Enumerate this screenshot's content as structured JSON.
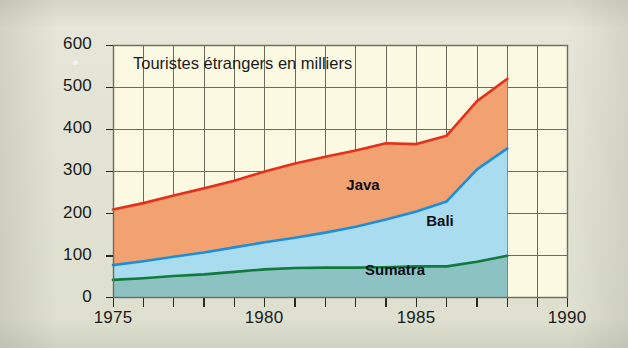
{
  "figure": {
    "plot_title": "Touristes étrangers en milliers",
    "background_color": "#e3e4d6",
    "plot_background_color": "#fbf9e2"
  },
  "axes": {
    "y_ticks": [
      "600",
      "500",
      "400",
      "300",
      "200",
      "100",
      "0"
    ],
    "x_ticks": [
      "1975",
      "1980",
      "1985",
      "1990"
    ]
  },
  "series_labels": {
    "java": "Java",
    "bali": "Bali",
    "sumatra": "Sumatra"
  },
  "chart_data": {
    "type": "area",
    "stacked": true,
    "title": "Touristes étrangers en milliers",
    "xlabel": "",
    "ylabel": "",
    "xlim": [
      1975,
      1990
    ],
    "ylim": [
      0,
      600
    ],
    "x_tick_labels": [
      "1975",
      "1980",
      "1985",
      "1990"
    ],
    "x_tick_values": [
      1975,
      1980,
      1985,
      1990
    ],
    "x_minor_tick_step": 1,
    "y_tick_labels": [
      "0",
      "100",
      "200",
      "300",
      "400",
      "500",
      "600"
    ],
    "y_tick_values": [
      0,
      100,
      200,
      300,
      400,
      500,
      600
    ],
    "grid": true,
    "legend_position": "in-plot annotations",
    "x": [
      1975,
      1976,
      1977,
      1978,
      1979,
      1980,
      1981,
      1982,
      1983,
      1984,
      1985,
      1986,
      1987,
      1988
    ],
    "series": [
      {
        "name": "Sumatra",
        "line_color": "#127a3c",
        "fill_color": "#8cc3c2",
        "values": [
          43,
          47,
          52,
          56,
          62,
          68,
          71,
          72,
          72,
          73,
          75,
          75,
          86,
          100
        ]
      },
      {
        "name": "Bali",
        "line_color": "#1d8fd6",
        "fill_color": "#a9dcee",
        "values": [
          35,
          40,
          46,
          52,
          58,
          64,
          72,
          83,
          97,
          113,
          130,
          154,
          219,
          255
        ]
      },
      {
        "name": "Java",
        "line_color": "#e6301b",
        "fill_color": "#f2a271",
        "values": [
          132,
          138,
          145,
          152,
          158,
          168,
          176,
          180,
          181,
          181,
          160,
          156,
          162,
          165
        ]
      }
    ],
    "cumulative_totals": {
      "sumatra_top": [
        43,
        47,
        52,
        56,
        62,
        68,
        71,
        72,
        72,
        73,
        75,
        75,
        86,
        100
      ],
      "bali_top": [
        78,
        87,
        98,
        108,
        120,
        132,
        143,
        155,
        169,
        186,
        205,
        229,
        305,
        355
      ],
      "java_top": [
        210,
        225,
        243,
        260,
        278,
        300,
        319,
        335,
        350,
        367,
        365,
        385,
        467,
        520
      ]
    }
  }
}
